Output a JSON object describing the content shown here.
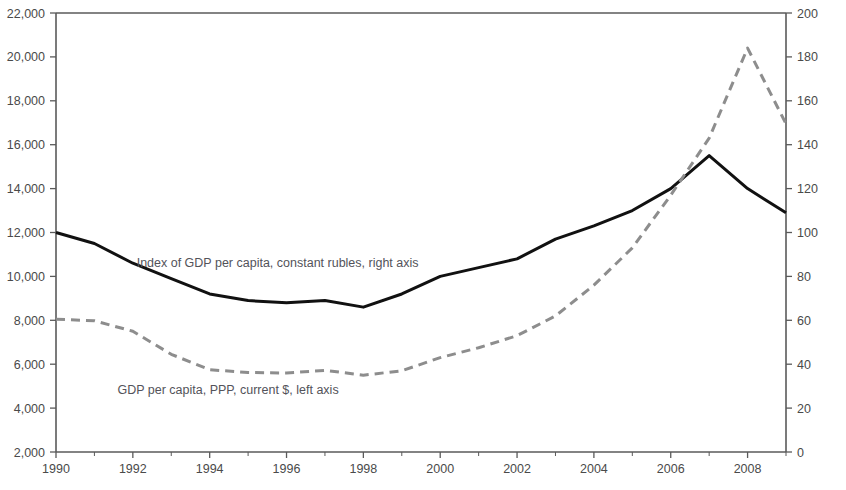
{
  "chart_data": {
    "type": "line",
    "title": "",
    "subtitle": "",
    "xlabel": "",
    "ylabel": "",
    "grid": false,
    "legend_position": "inline-annotations",
    "x": [
      1990,
      1991,
      1992,
      1993,
      1994,
      1995,
      1996,
      1997,
      1998,
      1999,
      2000,
      2001,
      2002,
      2003,
      2004,
      2005,
      2006,
      2007,
      2008,
      2009
    ],
    "x_tick_labels": [
      "1990",
      "1992",
      "1994",
      "1996",
      "1998",
      "2000",
      "2002",
      "2004",
      "2006",
      "2008"
    ],
    "x_tick_values": [
      1990,
      1992,
      1994,
      1996,
      1998,
      2000,
      2002,
      2004,
      2006,
      2008
    ],
    "xlim": [
      1990,
      2009
    ],
    "left_axis": {
      "label": "",
      "ylim": [
        2000,
        22000
      ],
      "tick_values": [
        2000,
        4000,
        6000,
        8000,
        10000,
        12000,
        14000,
        16000,
        18000,
        20000,
        22000
      ],
      "tick_labels": [
        "2,000",
        "4,000",
        "6,000",
        "8,000",
        "10,000",
        "12,000",
        "14,000",
        "16,000",
        "18,000",
        "20,000",
        "22,000"
      ]
    },
    "right_axis": {
      "label": "",
      "ylim": [
        0,
        200
      ],
      "tick_values": [
        0,
        20,
        40,
        60,
        80,
        100,
        120,
        140,
        160,
        180,
        200
      ],
      "tick_labels": [
        "0",
        "20",
        "40",
        "60",
        "80",
        "100",
        "120",
        "140",
        "160",
        "180",
        "200"
      ]
    },
    "series": [
      {
        "name": "Index of GDP per capita, constant rubles, right axis",
        "axis": "right",
        "style": "solid",
        "color": "#111111",
        "width": 3.0,
        "annotation": "Index of GDP per capita, constant rubles, right axis",
        "annotation_x": 1992.1,
        "annotation_y_left_equiv": 10450,
        "values": [
          100,
          95,
          86,
          79,
          72,
          69,
          68,
          69,
          66,
          72,
          80,
          84,
          88,
          97,
          103,
          110,
          120,
          135,
          120,
          109
        ]
      },
      {
        "name": "GDP per capita, PPP, current $, left axis",
        "axis": "left",
        "style": "dashed",
        "color": "#8d8d8d",
        "width": 3.0,
        "annotation": "GDP per capita, PPP, current $, left axis",
        "annotation_x": 1991.6,
        "annotation_y_left_equiv": 4620,
        "values": [
          8050,
          7980,
          7500,
          6450,
          5750,
          5620,
          5600,
          5720,
          5500,
          5700,
          6300,
          6750,
          7300,
          8200,
          9600,
          11300,
          13700,
          16300,
          20400,
          16950
        ]
      }
    ],
    "notes": {
      "solid_series_left_equivalent": [
        12000,
        11450,
        10350,
        9500,
        8450,
        8250,
        7980,
        8050,
        7790,
        8250,
        8800,
        9050,
        9450,
        10150,
        10750,
        11450,
        12100,
        13050,
        13800,
        12900
      ],
      "crossover_year": 2004.5
    }
  },
  "annotations": {
    "upper_label": "Index of GDP per capita, constant rubles, right axis",
    "lower_label": "GDP per capita, PPP, current $, left axis"
  },
  "colors": {
    "solid_line": "#111111",
    "dashed_line": "#8d8d8d",
    "axis": "#5a5a5a",
    "text": "#4a4a4a",
    "background": "#ffffff"
  }
}
